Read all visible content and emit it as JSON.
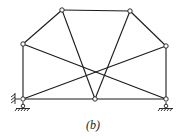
{
  "diagram": {
    "type": "truss",
    "caption": "(b)",
    "colors": {
      "line": "#1a1a1a",
      "node_fill": "#ffffff",
      "background": "#ffffff"
    },
    "nodes": [
      {
        "id": "A",
        "x": 23,
        "y": 99
      },
      {
        "id": "B",
        "x": 95,
        "y": 99
      },
      {
        "id": "C",
        "x": 166,
        "y": 99
      },
      {
        "id": "D",
        "x": 23,
        "y": 44
      },
      {
        "id": "E",
        "x": 62,
        "y": 10
      },
      {
        "id": "F",
        "x": 130,
        "y": 11
      },
      {
        "id": "G",
        "x": 166,
        "y": 46
      }
    ],
    "members": [
      [
        "A",
        "B"
      ],
      [
        "B",
        "C"
      ],
      [
        "A",
        "D"
      ],
      [
        "D",
        "E"
      ],
      [
        "E",
        "F"
      ],
      [
        "F",
        "G"
      ],
      [
        "G",
        "C"
      ],
      [
        "E",
        "B"
      ],
      [
        "F",
        "B"
      ],
      [
        "D",
        "C"
      ],
      [
        "A",
        "G"
      ]
    ],
    "supports": [
      {
        "node": "A",
        "type": "pin-with-roller-and-wall"
      },
      {
        "node": "C",
        "type": "roller"
      }
    ]
  }
}
